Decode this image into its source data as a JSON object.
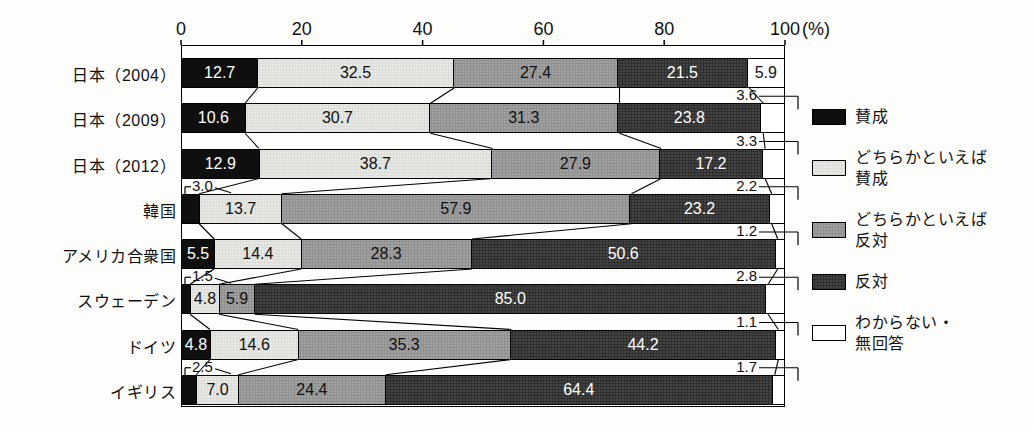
{
  "axis": {
    "ticks": [
      "0",
      "20",
      "40",
      "60",
      "80",
      "100"
    ],
    "unit": "(%)"
  },
  "legend": {
    "items": [
      {
        "name": "賛成",
        "lines": [
          "賛成"
        ],
        "color": "#0f0f0f",
        "pattern": 0
      },
      {
        "name": "どちらかといえば賛成",
        "lines": [
          "どちらかといえば",
          "賛成"
        ],
        "color": "#e9e9e6",
        "pattern": 1
      },
      {
        "name": "どちらかといえば反対",
        "lines": [
          "どちらかといえば",
          "反対"
        ],
        "color": "#a2a2a2",
        "pattern": 2
      },
      {
        "name": "反対",
        "lines": [
          "反対"
        ],
        "color": "#454545",
        "pattern": 3
      },
      {
        "name": "わからない・無回答",
        "lines": [
          "わからない・",
          "無回答"
        ],
        "color": "#ffffff",
        "pattern": 4
      }
    ]
  },
  "chart_data": {
    "type": "bar",
    "stacked": true,
    "orientation": "horizontal",
    "unit": "%",
    "xlim": [
      0,
      100
    ],
    "grid": false,
    "legend_position": "right",
    "categories": [
      "日本（2004）",
      "日本（2009）",
      "日本（2012）",
      "韓国",
      "アメリカ合衆国",
      "スウェーデン",
      "ドイツ",
      "イギリス"
    ],
    "series": [
      {
        "name": "賛成",
        "color": "#0f0f0f",
        "text_color": "#ffffff",
        "values": [
          12.7,
          10.6,
          12.9,
          3.0,
          5.5,
          1.5,
          4.8,
          2.5
        ]
      },
      {
        "name": "どちらかといえば賛成",
        "color": "#e9e9e6",
        "text_color": "#111111",
        "values": [
          32.5,
          30.7,
          38.7,
          13.7,
          14.4,
          4.8,
          14.6,
          7.0
        ]
      },
      {
        "name": "どちらかといえば反対",
        "color": "#a2a2a2",
        "text_color": "#111111",
        "values": [
          27.4,
          31.3,
          27.9,
          57.9,
          28.3,
          5.9,
          35.3,
          24.4
        ]
      },
      {
        "name": "反対",
        "color": "#454545",
        "text_color": "#ffffff",
        "values": [
          21.5,
          23.8,
          17.2,
          23.2,
          50.6,
          85.0,
          44.2,
          64.4
        ]
      },
      {
        "name": "わからない・無回答",
        "color": "#ffffff",
        "text_color": "#111111",
        "values": [
          5.9,
          3.6,
          3.3,
          2.2,
          1.2,
          2.8,
          1.1,
          1.7
        ]
      }
    ]
  }
}
